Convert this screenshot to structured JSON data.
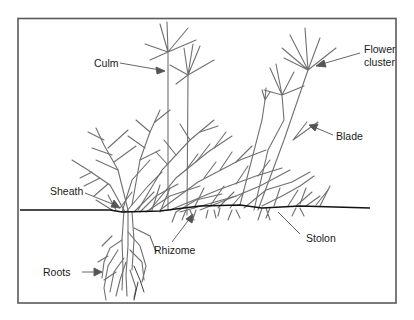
{
  "diagram": {
    "labels": {
      "culm": "Culm",
      "flower_cluster_line1": "Flower",
      "flower_cluster_line2": "cluster",
      "blade": "Blade",
      "sheath": "Sheath",
      "rhizome": "Rhizome",
      "stolon": "Stolon",
      "roots": "Roots"
    },
    "colors": {
      "plant": "#6e6e6e",
      "ground_line": "#111111",
      "border": "#555555",
      "label_text": "#1a1a1a"
    }
  }
}
